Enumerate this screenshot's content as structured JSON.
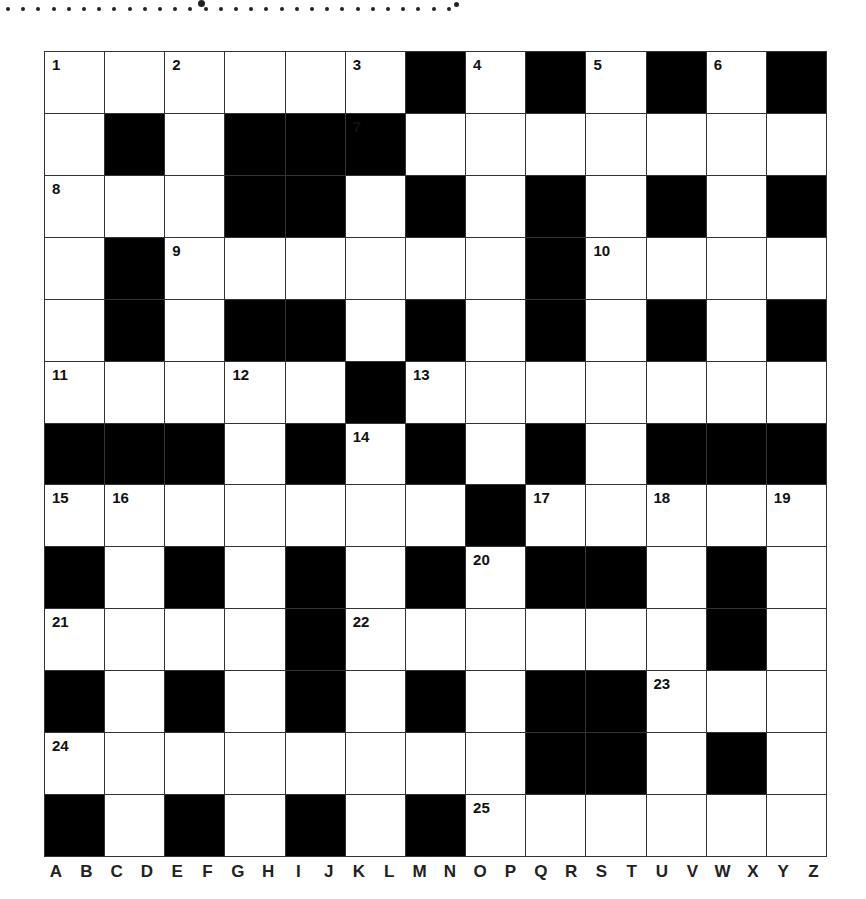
{
  "puzzle": {
    "rows": 13,
    "cols": 13,
    "grid": [
      "WWWWWWBWBWBWB",
      "WBWBBBWWWWWWW",
      "WWWBBWBWBWBWB",
      "WBWWWWWWBWWWW",
      "WBWBBWBWBWBWB",
      "WWWWWBWWWWWWW",
      "BBBWBWBWBWBBB",
      "WWWWWWWBWWWWW",
      "BWBWBWBWBBWBW",
      "WWWWBWWWWWWBW",
      "BWBWBWBWBBWWW",
      "WWWWWWWWBBWBW",
      "BWBWBWBWWWWWW"
    ],
    "numbers": [
      {
        "n": "1",
        "r": 0,
        "c": 0
      },
      {
        "n": "2",
        "r": 0,
        "c": 2
      },
      {
        "n": "3",
        "r": 0,
        "c": 5
      },
      {
        "n": "4",
        "r": 0,
        "c": 7
      },
      {
        "n": "5",
        "r": 0,
        "c": 9
      },
      {
        "n": "6",
        "r": 0,
        "c": 11
      },
      {
        "n": "7",
        "r": 1,
        "c": 5
      },
      {
        "n": "8",
        "r": 2,
        "c": 0
      },
      {
        "n": "9",
        "r": 3,
        "c": 2
      },
      {
        "n": "10",
        "r": 3,
        "c": 9
      },
      {
        "n": "11",
        "r": 5,
        "c": 0
      },
      {
        "n": "12",
        "r": 5,
        "c": 3
      },
      {
        "n": "13",
        "r": 5,
        "c": 6
      },
      {
        "n": "14",
        "r": 6,
        "c": 5
      },
      {
        "n": "15",
        "r": 7,
        "c": 0
      },
      {
        "n": "16",
        "r": 7,
        "c": 1
      },
      {
        "n": "17",
        "r": 7,
        "c": 8
      },
      {
        "n": "18",
        "r": 7,
        "c": 10
      },
      {
        "n": "19",
        "r": 7,
        "c": 12
      },
      {
        "n": "20",
        "r": 8,
        "c": 7
      },
      {
        "n": "21",
        "r": 9,
        "c": 0
      },
      {
        "n": "22",
        "r": 9,
        "c": 5
      },
      {
        "n": "23",
        "r": 10,
        "c": 10
      },
      {
        "n": "24",
        "r": 11,
        "c": 0
      },
      {
        "n": "25",
        "r": 12,
        "c": 7
      }
    ]
  },
  "alphabet": [
    "A",
    "B",
    "C",
    "D",
    "E",
    "F",
    "G",
    "H",
    "I",
    "J",
    "K",
    "L",
    "M",
    "N",
    "O",
    "P",
    "Q",
    "R",
    "S",
    "T",
    "U",
    "V",
    "W",
    "X",
    "Y",
    "Z"
  ],
  "colors": {
    "block": "#000000",
    "cell": "#ffffff",
    "line": "#333333"
  }
}
